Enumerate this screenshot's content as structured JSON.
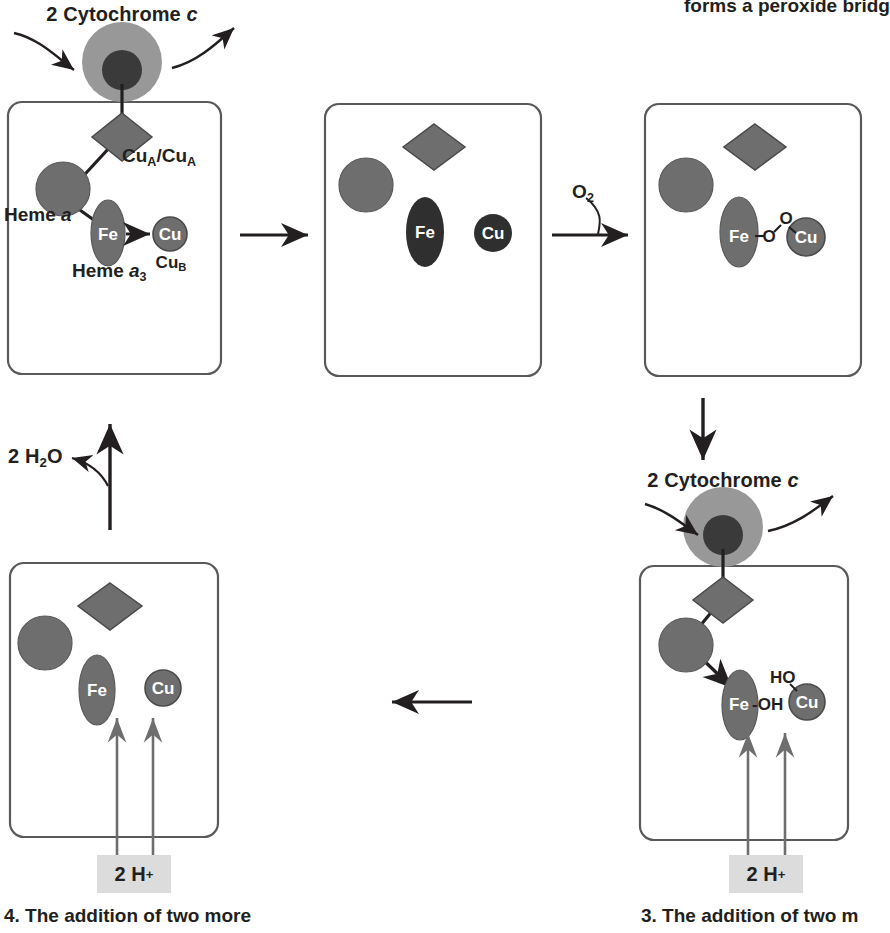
{
  "figure": {
    "title_fragment_top_right": "forms a peroxide bridg",
    "type": "catalytic-cycle-diagram"
  },
  "colors": {
    "heme_gray": "#6e6e6e",
    "heme_dark": "#3a3a3a",
    "cyt_outer": "#989898",
    "cyt_inner": "#3a3a3a",
    "panel_stroke": "#5a5a5a",
    "line": "#231f20",
    "hbox_bg": "#dcdcdc",
    "label_white": "#ffffff"
  },
  "panels": [
    {
      "id": "panel-1",
      "position": "top-left",
      "cytochrome_label": "2 Cytochrome c",
      "cytochrome_italic": "c",
      "labels": {
        "cua": "Cu",
        "cua_sub": "A",
        "cua_pair": "Cu",
        "cua_pair_sub": "A",
        "cua_separator": "/",
        "heme_a": "Heme",
        "heme_a_italic": "a",
        "heme_a3": "Heme",
        "heme_a3_italic": "a",
        "heme_a3_sub": "3",
        "fe": "Fe",
        "cu": "Cu",
        "cub": "Cu",
        "cub_sub": "B"
      },
      "state": "oxidized-with-electron-transfer"
    },
    {
      "id": "panel-2",
      "position": "top-middle",
      "labels": {
        "fe": "Fe",
        "cu": "Cu"
      },
      "state": "fully-reduced"
    },
    {
      "id": "panel-3",
      "position": "top-right",
      "labels": {
        "fe": "Fe",
        "o1": "O",
        "o2": "O",
        "cu": "Cu"
      },
      "bond_text": "Fe-O-O-Cu",
      "state": "peroxide-bridge"
    },
    {
      "id": "panel-4",
      "position": "bottom-right",
      "cytochrome_label": "2 Cytochrome c",
      "cytochrome_italic": "c",
      "labels": {
        "fe": "Fe",
        "oh": "-OH",
        "ho": "HO",
        "cu": "Cu"
      },
      "proton_label": "2 H",
      "proton_sup": "+",
      "state": "hydroxide-intermediate"
    },
    {
      "id": "panel-5",
      "position": "bottom-left",
      "labels": {
        "fe": "Fe",
        "cu": "Cu"
      },
      "proton_label": "2 H",
      "proton_sup": "+",
      "state": "reduced-after-protons"
    }
  ],
  "arrows": {
    "a1_label": "",
    "a2_label": "O",
    "a2_sub": "2",
    "water_label": "2 H",
    "water_sub": "2",
    "water_tail": "O"
  },
  "captions": {
    "left": "4. The addition of two more",
    "right": "3. The addition of two m"
  }
}
